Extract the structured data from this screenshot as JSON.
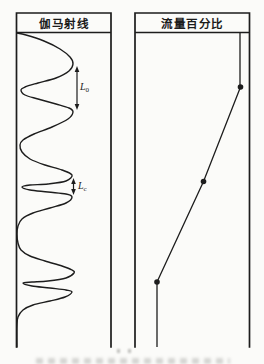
{
  "figure": {
    "ink": "#1d1d1d",
    "background": "#fbfbf9",
    "tracks": [
      {
        "id": "gamma",
        "title": "伽马射线"
      },
      {
        "id": "flow",
        "title": "流量百分比"
      }
    ],
    "annotations": {
      "peak_spacing_label": {
        "base": "L",
        "sub": "0"
      },
      "thin_spacing_label": {
        "base": "L",
        "sub": "c"
      }
    },
    "geometry": {
      "track_boxes": [
        {
          "x1": 16.5,
          "x2": 111
        },
        {
          "x1": 135,
          "x2": 249.5
        }
      ],
      "top": 13,
      "header_bottom": 32.5,
      "bottom": 347,
      "gamma_curve_points": [
        [
          17,
          33
        ],
        [
          26,
          35
        ],
        [
          44,
          41
        ],
        [
          60,
          49
        ],
        [
          70,
          57
        ],
        [
          73,
          64
        ],
        [
          69,
          71
        ],
        [
          56,
          78
        ],
        [
          38,
          83
        ],
        [
          25,
          87
        ],
        [
          21,
          90
        ],
        [
          25,
          95
        ],
        [
          38,
          99
        ],
        [
          56,
          104
        ],
        [
          69,
          108
        ],
        [
          73,
          112
        ],
        [
          68,
          119
        ],
        [
          52,
          127
        ],
        [
          34,
          134
        ],
        [
          23,
          140
        ],
        [
          20,
          145
        ],
        [
          22,
          152
        ],
        [
          30,
          159
        ],
        [
          45,
          165
        ],
        [
          62,
          170
        ],
        [
          72,
          175
        ],
        [
          66,
          181
        ],
        [
          48,
          184
        ],
        [
          30,
          185
        ],
        [
          22,
          187
        ],
        [
          30,
          190
        ],
        [
          48,
          192
        ],
        [
          66,
          194
        ],
        [
          72,
          197
        ],
        [
          66,
          203
        ],
        [
          50,
          208
        ],
        [
          33,
          213
        ],
        [
          22,
          219
        ],
        [
          18,
          226
        ],
        [
          17,
          234
        ],
        [
          18,
          243
        ],
        [
          21,
          250
        ],
        [
          30,
          256
        ],
        [
          45,
          261
        ],
        [
          62,
          266
        ],
        [
          72,
          270
        ],
        [
          74,
          273
        ],
        [
          66,
          278
        ],
        [
          48,
          281
        ],
        [
          32,
          282
        ],
        [
          23,
          283
        ],
        [
          32,
          286
        ],
        [
          50,
          288
        ],
        [
          66,
          290
        ],
        [
          72,
          292
        ],
        [
          65,
          297
        ],
        [
          50,
          301
        ],
        [
          33,
          305
        ],
        [
          23,
          310
        ],
        [
          18,
          317
        ],
        [
          17,
          326
        ],
        [
          17,
          347
        ]
      ],
      "arrows": [
        {
          "x": 77,
          "y_top": 66,
          "y_bottom": 110
        },
        {
          "x": 73.5,
          "y_top": 178,
          "y_bottom": 195
        }
      ],
      "flow": {
        "top_line": {
          "x": 240,
          "y1": 33,
          "y2": 87
        },
        "points": [
          [
            240.5,
            87
          ],
          [
            203.5,
            181.5
          ],
          [
            157,
            282
          ]
        ],
        "bottom_line": {
          "x": 157,
          "y1": 282,
          "y2": 347
        }
      },
      "dot_radius": 2.8
    }
  }
}
